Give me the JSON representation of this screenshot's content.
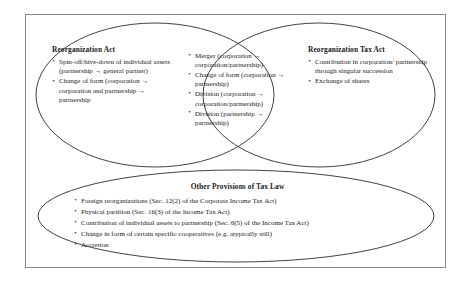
{
  "diagram": {
    "type": "venn",
    "title_present": false,
    "sets": {
      "left": {
        "heading": "Reorganization Act",
        "items": [
          "Spin-off/hive-down of individual assets (partnership → general partner)",
          "Change of form (corporation → corporation and partnership → partnership"
        ]
      },
      "intersection": {
        "heading": "",
        "items": [
          "Merger (corporation → corporation/partnership)",
          "Change of form (corporation → partnership)",
          "Division (corporation → corporation/partnership)",
          "Division (partnership → partnership)"
        ]
      },
      "right": {
        "heading": "Reorganization Tax Act",
        "items": [
          "Contribution in corporation/ partnership through singular succession",
          "Exchange of shares"
        ]
      },
      "bottom": {
        "heading": "Other Provisions of Tax Law",
        "items": [
          "Foreign reorganizations (Sec. 12(2) of the Corporate Income Tax Act)",
          "Physical partition (Sec. 16(3) of the Income Tax Act)",
          "Contribution of individual assets to partnership (Sec. 6(5) of  the Income Tax Act)",
          "Change in form of certain specific cooperatives (e.g. atypically still)",
          "Accretion"
        ]
      }
    },
    "colors": {
      "outline": "#2b2b2b",
      "frame": "#8a8a8a",
      "background": "#ffffff",
      "text": "#1a1a1a"
    }
  }
}
